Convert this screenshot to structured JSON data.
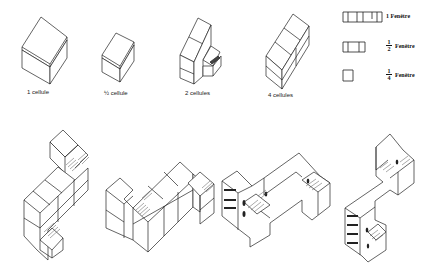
{
  "diagram": {
    "title": "",
    "cells": [
      {
        "label": "1 cellule"
      },
      {
        "label": "½ cellule"
      },
      {
        "label": "2 cellules"
      },
      {
        "label": "4 cellules"
      }
    ],
    "legend": [
      {
        "symbol": "window-4-pane",
        "num": "1",
        "den": "",
        "text": "Fenêtre",
        "whole_label": "1"
      },
      {
        "symbol": "window-3-pane",
        "num": "1",
        "den": "2",
        "text": "Fenêtre"
      },
      {
        "symbol": "window-1-pane",
        "num": "1",
        "den": "4",
        "text": "Fenêtre"
      }
    ],
    "assemblies": [
      {
        "name": "L-shaped assembly with stairs"
      },
      {
        "name": "Z-shaped assembly with stairs"
      },
      {
        "name": "Rendered U-shaped building"
      },
      {
        "name": "Rendered L-shaped building"
      }
    ],
    "colors": {
      "line": "#222222",
      "background": "#ffffff",
      "hatch": "#555555"
    }
  }
}
